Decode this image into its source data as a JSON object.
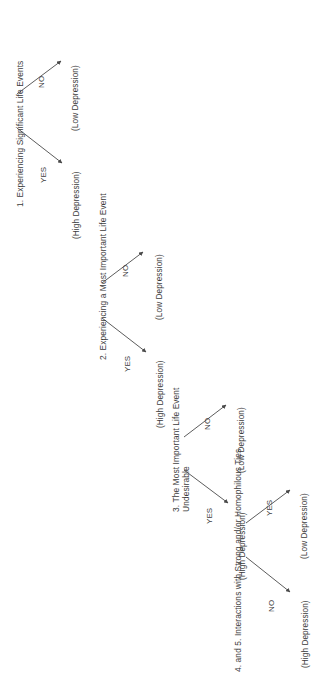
{
  "figure": {
    "type": "decision-tree",
    "orientation": "rotated-90-ccw",
    "background_color": "#ffffff",
    "line_color": "#4a4a4a",
    "text_color": "#3c3c3c"
  },
  "nodes": [
    {
      "id": "node1",
      "label": "1.  Experiencing Significant Life Events",
      "label_lines": [
        "1.  Experiencing Significant Life Events"
      ]
    },
    {
      "id": "node2",
      "label": "2. Experiencing a Most Important Life Event",
      "label_lines": [
        "2. Experiencing a Most Important Life Event"
      ]
    },
    {
      "id": "node3",
      "label": "3. The Most Important Life Event Undesirable",
      "label_lines": [
        "3. The Most Important Life Event",
        "Undesirable"
      ]
    },
    {
      "id": "node4",
      "label": "4. and 5.  Interactions with Strong and/or Homophilous Ties",
      "label_lines": [
        "4. and 5.  Interactions with Strong and/or Homophilous Ties"
      ]
    }
  ],
  "edges": [
    {
      "id": "e1-no",
      "from": "node1",
      "label": "NO",
      "to": "out1"
    },
    {
      "id": "e1-yes",
      "from": "node1",
      "label": "YES",
      "to": "out2"
    },
    {
      "id": "e2-no",
      "from": "node2",
      "label": "NO",
      "to": "out3"
    },
    {
      "id": "e2-yes",
      "from": "node2",
      "label": "YES",
      "to": "out4"
    },
    {
      "id": "e3-no",
      "from": "node3",
      "label": "NO",
      "to": "out5"
    },
    {
      "id": "e3-yes",
      "from": "node3",
      "label": "YES",
      "to": "out6"
    },
    {
      "id": "e4-yes",
      "from": "node4",
      "label": "YES",
      "to": "out7"
    },
    {
      "id": "e4-no",
      "from": "node4",
      "label": "NO",
      "to": "out8"
    }
  ],
  "outcomes": [
    {
      "id": "out1",
      "label": "(Low Depression)"
    },
    {
      "id": "out2",
      "label": "(High Depression)"
    },
    {
      "id": "out3",
      "label": "(Low Depression)"
    },
    {
      "id": "out4",
      "label": "(High Depression)"
    },
    {
      "id": "out5",
      "label": "(Low Depression)"
    },
    {
      "id": "out6",
      "label": "(High Depression)"
    },
    {
      "id": "out7",
      "label": "(Low Depression)"
    },
    {
      "id": "out8",
      "label": "(High Depression)"
    }
  ]
}
